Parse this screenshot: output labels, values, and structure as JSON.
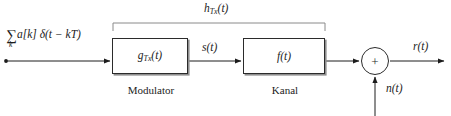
{
  "diagram": {
    "width": 451,
    "height": 116,
    "background": "#ffffff",
    "line_color": "#2b2b2b",
    "shadow_color": "#8e8e8e"
  },
  "input": {
    "sigma": "∑",
    "sigma_index": "k",
    "expression_body": "a[k] δ(t − kT)",
    "full_text": "∑_k a[k] δ(t − kT)"
  },
  "blocks": [
    {
      "id": "modulator",
      "label_main": "g",
      "label_sub": "Tx",
      "label_tail": "(t)",
      "label_full": "g_Tx(t)",
      "caption": "Modulator"
    },
    {
      "id": "channel",
      "label_main": "f",
      "label_sub": "",
      "label_tail": "(t)",
      "label_full": "f(t)",
      "caption": "Kanal"
    }
  ],
  "signals": {
    "intermediate": {
      "main": "s",
      "tail": "(t)",
      "full": "s(t)"
    },
    "output": {
      "main": "r",
      "tail": "(t)",
      "full": "r(t)"
    },
    "noise": {
      "main": "n",
      "tail": "(t)",
      "full": "n(t)"
    }
  },
  "bracket": {
    "label_main": "h",
    "label_sub": "Tx",
    "label_tail": "(t)",
    "label_full": "h_Tx(t)",
    "spans": [
      "modulator",
      "channel"
    ]
  },
  "summing_junction": {
    "operator": "+",
    "shape": "circle"
  }
}
